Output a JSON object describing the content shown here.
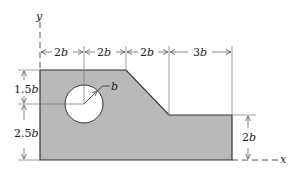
{
  "diagram": {
    "axes": {
      "x_label": "x",
      "y_label": "y"
    },
    "horizontal_dimensions": [
      {
        "value": "2",
        "unit": "b"
      },
      {
        "value": "2",
        "unit": "b"
      },
      {
        "value": "2",
        "unit": "b"
      },
      {
        "value": "3",
        "unit": "b"
      }
    ],
    "vertical_dimensions_left": [
      {
        "value": "1.5",
        "unit": "b"
      },
      {
        "value": "2.5",
        "unit": "b"
      }
    ],
    "vertical_dimension_right": {
      "value": "2",
      "unit": "b"
    },
    "hole_radius_label": "b",
    "colors": {
      "fill": "#b9b9b9",
      "outline": "#333333",
      "line": "#555555"
    }
  }
}
